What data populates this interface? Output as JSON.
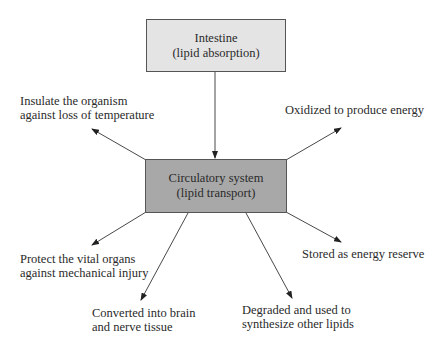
{
  "diagram": {
    "source_node": {
      "line1": "Intestine",
      "line2": "(lipid absorption)",
      "fill": "#e4e4e4"
    },
    "hub_node": {
      "line1": "Circulatory system",
      "line2": "(lipid transport)",
      "fill": "#a8a8a8"
    },
    "outputs": [
      {
        "id": "insulate",
        "line1": "Insulate the organism",
        "line2": "against loss of temperature"
      },
      {
        "id": "oxidize",
        "line1": "Oxidized to produce energy",
        "line2": ""
      },
      {
        "id": "protect",
        "line1": "Protect the vital organs",
        "line2": "against mechanical injury"
      },
      {
        "id": "convert",
        "line1": "Converted into brain",
        "line2": "and nerve tissue"
      },
      {
        "id": "degrade",
        "line1": "Degraded and used to",
        "line2": "synthesize other lipids"
      },
      {
        "id": "store",
        "line1": "Stored as energy reserve",
        "line2": ""
      }
    ],
    "edges": [
      {
        "from": "Intestine",
        "to": "Circulatory system"
      },
      {
        "from": "Circulatory system",
        "to": "insulate"
      },
      {
        "from": "Circulatory system",
        "to": "oxidize"
      },
      {
        "from": "Circulatory system",
        "to": "protect"
      },
      {
        "from": "Circulatory system",
        "to": "convert"
      },
      {
        "from": "Circulatory system",
        "to": "degrade"
      },
      {
        "from": "Circulatory system",
        "to": "store"
      }
    ]
  }
}
